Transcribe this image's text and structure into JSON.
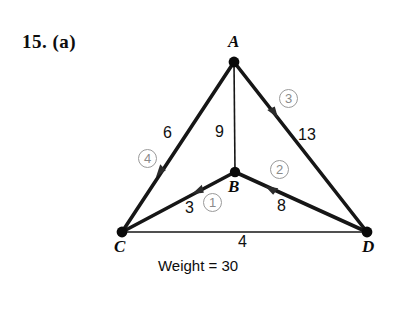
{
  "problem": {
    "number_label": "15. (a)"
  },
  "graph": {
    "type": "weighted-graph-diagram",
    "vertices": [
      {
        "id": "A",
        "label": "A",
        "x": 234,
        "y": 62
      },
      {
        "id": "B",
        "label": "B",
        "x": 235,
        "y": 172
      },
      {
        "id": "C",
        "label": "C",
        "x": 122,
        "y": 232
      },
      {
        "id": "D",
        "label": "D",
        "x": 367,
        "y": 232
      }
    ],
    "edges": [
      {
        "id": "CA",
        "from": "C",
        "to": "A",
        "weight": "6",
        "thick": true,
        "selected": true
      },
      {
        "id": "AB",
        "from": "A",
        "to": "B",
        "weight": "9",
        "thick": false,
        "selected": false
      },
      {
        "id": "AD",
        "from": "A",
        "to": "D",
        "weight": "13",
        "thick": true,
        "selected": true
      },
      {
        "id": "CB",
        "from": "C",
        "to": "B",
        "weight": "3",
        "thick": true,
        "selected": true
      },
      {
        "id": "BD",
        "from": "B",
        "to": "D",
        "weight": "8",
        "thick": true,
        "selected": true
      },
      {
        "id": "CD",
        "from": "C",
        "to": "D",
        "weight": "4",
        "thick": false,
        "selected": false
      }
    ],
    "selection_order": [
      {
        "step": "1",
        "edge": "CB"
      },
      {
        "step": "2",
        "edge": "BD"
      },
      {
        "step": "3",
        "edge": "AD"
      },
      {
        "step": "4",
        "edge": "CA"
      }
    ],
    "caption": "Weight = 30",
    "colors": {
      "edge": "#161616",
      "vertex": "#0a0a0a",
      "order_marker": "#9a9a9a",
      "background": "#ffffff"
    }
  }
}
